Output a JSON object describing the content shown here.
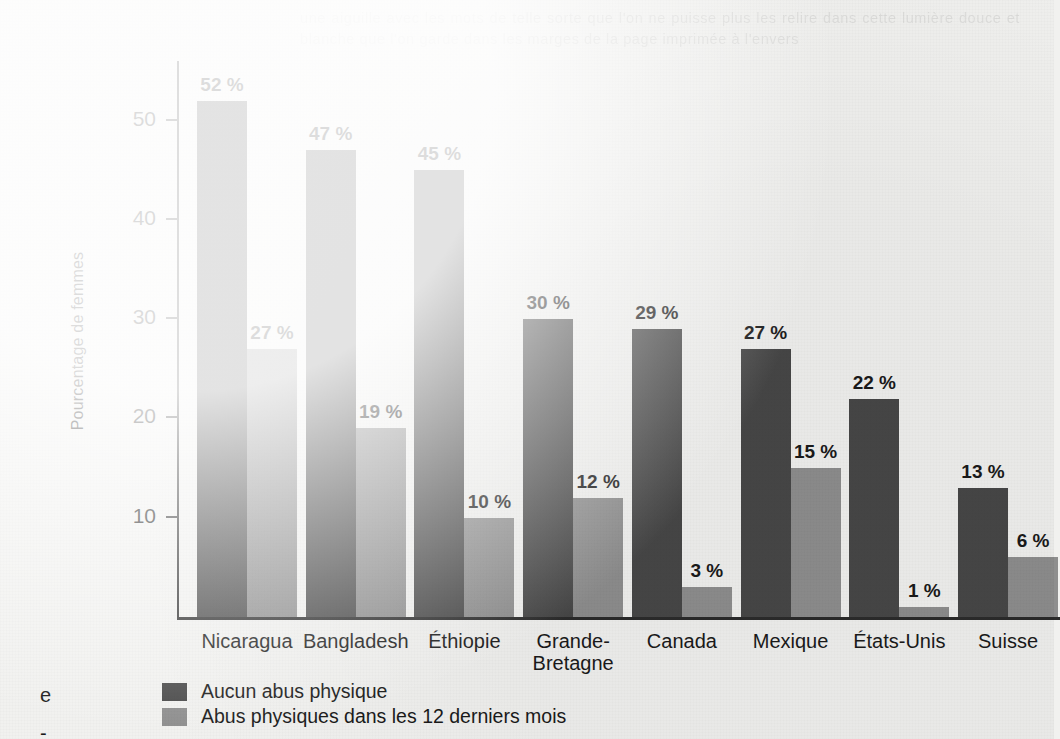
{
  "chart_data": {
    "type": "bar",
    "title": "",
    "xlabel": "",
    "ylabel": "Pourcentage de femmes",
    "ylim": [
      0,
      56
    ],
    "yticks": [
      10,
      20,
      30,
      40,
      50
    ],
    "ytick_labels": [
      "10",
      "20",
      "30",
      "40",
      "50"
    ],
    "value_suffix": " %",
    "grid": false,
    "legend_position": "bottom-left",
    "categories": [
      "Nicaragua",
      "Bangladesh",
      "Éthiopie",
      "Grande-\nBretagne",
      "Canada",
      "Mexique",
      "États-Unis",
      "Suisse"
    ],
    "series": [
      {
        "name": "Aucun abus physique",
        "color": "#474747",
        "values": [
          52,
          47,
          45,
          30,
          29,
          27,
          22,
          13
        ],
        "labels": [
          "52 %",
          "47 %",
          "45 %",
          "30 %",
          "29 %",
          "27 %",
          "22 %",
          "13 %"
        ]
      },
      {
        "name": "Abus physiques dans les 12 derniers mois",
        "color": "#8e8e8e",
        "values": [
          27,
          19,
          10,
          12,
          3,
          15,
          1,
          6
        ],
        "labels": [
          "27 %",
          "19 %",
          "10 %",
          "12 %",
          "3 %",
          "15 %",
          "1 %",
          "6 %"
        ]
      }
    ]
  },
  "legend": {
    "items": [
      {
        "label": "Aucun abus physique",
        "color": "#474747"
      },
      {
        "label": "Abus physiques dans les 12 derniers mois",
        "color": "#8e8e8e"
      }
    ]
  },
  "margin_fragments": [
    {
      "text": "e",
      "top": "668px"
    },
    {
      "text": "-",
      "top": "706px"
    }
  ],
  "bleed_through": {
    "text": "une aiguille avec les mots de telle sorte que l'on ne puisse plus les relire dans cette lumière douce et blanche que l'on garde dans les marges de la page imprimée à l'envers"
  },
  "colors": {
    "background": "#f1f1ef",
    "axis": "#2b2b2b",
    "text": "#1a1a1a",
    "series_dark": "#474747",
    "series_light": "#8e8e8e"
  }
}
